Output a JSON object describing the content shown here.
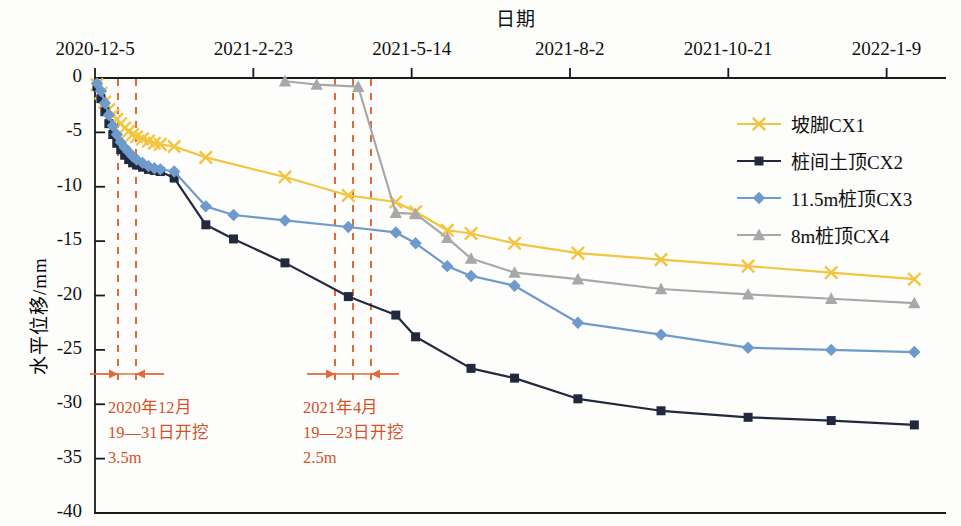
{
  "chart": {
    "title": "日期",
    "ylabel": "水平位移/mm",
    "xlabel": ""
  },
  "axes": {
    "x_tick_labels": [
      "2020-12-5",
      "2021-2-23",
      "2021-5-14",
      "2021-8-2",
      "2021-10-21",
      "2022-1-9"
    ],
    "y_tick_labels": [
      "0",
      "-5",
      "-10",
      "-15",
      "-20",
      "-25",
      "-30",
      "-35",
      "-40"
    ]
  },
  "legend": {
    "items": [
      {
        "label": "坡脚CX1",
        "color": "#F3C53F",
        "marker": "x-marker"
      },
      {
        "label": "桩间土顶CX2",
        "color": "#22293F",
        "marker": "square-marker"
      },
      {
        "label": "11.5m桩顶CX3",
        "color": "#6E9BCB",
        "marker": "diamond-marker"
      },
      {
        "label": "8m桩顶CX4",
        "color": "#A8A8A8",
        "marker": "triangle-marker"
      }
    ]
  },
  "annotations": [
    {
      "name": "excavation-1",
      "lines": [
        "2020年12月",
        "19—31日开挖",
        "3.5m"
      ],
      "color": "#D2522A",
      "span_start_x": 118,
      "span_end_x": 136
    },
    {
      "name": "excavation-2",
      "lines": [
        "2021年4月",
        "19—23日开挖",
        "2.5m"
      ],
      "color": "#D2522A",
      "span_start_x": 335,
      "span_end_x": 371
    }
  ],
  "marker_lines": {
    "color": "#E2693A",
    "group1_x": [
      118,
      136
    ],
    "group2_x": [
      335,
      353,
      371
    ]
  },
  "chart_data": {
    "type": "line",
    "title": "日期",
    "xlabel": "日期",
    "ylabel": "水平位移/mm",
    "ylim": [
      -40,
      0
    ],
    "xlim": [
      0,
      430
    ],
    "grid": false,
    "legend_position": "upper-right",
    "x_axis_type": "date",
    "x_tick_dates": [
      "2020-12-5",
      "2021-2-23",
      "2021-5-14",
      "2021-8-2",
      "2021-10-21",
      "2022-1-9"
    ],
    "x_tick_days": [
      0,
      80,
      160,
      240,
      320,
      400
    ],
    "series": [
      {
        "name": "坡脚CX1",
        "color": "#F3C53F",
        "marker": "x-marker",
        "points": [
          [
            1,
            -0.6
          ],
          [
            3,
            -1.4
          ],
          [
            5,
            -2.2
          ],
          [
            7,
            -2.9
          ],
          [
            9,
            -3.4
          ],
          [
            11,
            -3.8
          ],
          [
            13,
            -4.2
          ],
          [
            15,
            -4.6
          ],
          [
            17,
            -4.9
          ],
          [
            19,
            -5.2
          ],
          [
            21,
            -5.4
          ],
          [
            24,
            -5.6
          ],
          [
            27,
            -5.8
          ],
          [
            30,
            -6.0
          ],
          [
            33,
            -6.1
          ],
          [
            40,
            -6.3
          ],
          [
            56,
            -7.3
          ],
          [
            96,
            -9.1
          ],
          [
            128,
            -10.8
          ],
          [
            152,
            -11.4
          ],
          [
            162,
            -12.3
          ],
          [
            178,
            -14.0
          ],
          [
            190,
            -14.3
          ],
          [
            212,
            -15.2
          ],
          [
            244,
            -16.1
          ],
          [
            286,
            -16.7
          ],
          [
            330,
            -17.3
          ],
          [
            372,
            -17.9
          ],
          [
            414,
            -18.5
          ]
        ]
      },
      {
        "name": "桩间土顶CX2",
        "color": "#22293F",
        "marker": "square-marker",
        "points": [
          [
            1,
            -0.8
          ],
          [
            3,
            -1.9
          ],
          [
            5,
            -3.1
          ],
          [
            7,
            -4.2
          ],
          [
            9,
            -5.2
          ],
          [
            11,
            -6.0
          ],
          [
            13,
            -6.6
          ],
          [
            15,
            -7.1
          ],
          [
            17,
            -7.5
          ],
          [
            19,
            -7.8
          ],
          [
            21,
            -8.0
          ],
          [
            24,
            -8.2
          ],
          [
            27,
            -8.4
          ],
          [
            30,
            -8.5
          ],
          [
            33,
            -8.6
          ],
          [
            40,
            -9.2
          ],
          [
            56,
            -13.5
          ],
          [
            70,
            -14.8
          ],
          [
            96,
            -17.0
          ],
          [
            128,
            -20.1
          ],
          [
            152,
            -21.8
          ],
          [
            162,
            -23.8
          ],
          [
            190,
            -26.7
          ],
          [
            212,
            -27.6
          ],
          [
            244,
            -29.5
          ],
          [
            286,
            -30.6
          ],
          [
            330,
            -31.2
          ],
          [
            372,
            -31.5
          ],
          [
            414,
            -31.9
          ]
        ]
      },
      {
        "name": "11.5m桩顶CX3",
        "color": "#6E9BCB",
        "marker": "diamond-marker",
        "points": [
          [
            1,
            -0.5
          ],
          [
            3,
            -1.2
          ],
          [
            5,
            -2.3
          ],
          [
            7,
            -3.4
          ],
          [
            9,
            -4.4
          ],
          [
            11,
            -5.2
          ],
          [
            13,
            -5.9
          ],
          [
            15,
            -6.4
          ],
          [
            17,
            -6.8
          ],
          [
            19,
            -7.2
          ],
          [
            21,
            -7.5
          ],
          [
            24,
            -7.8
          ],
          [
            27,
            -8.1
          ],
          [
            30,
            -8.3
          ],
          [
            33,
            -8.4
          ],
          [
            40,
            -8.6
          ],
          [
            56,
            -11.8
          ],
          [
            70,
            -12.6
          ],
          [
            96,
            -13.1
          ],
          [
            128,
            -13.7
          ],
          [
            152,
            -14.2
          ],
          [
            162,
            -15.2
          ],
          [
            178,
            -17.3
          ],
          [
            190,
            -18.2
          ],
          [
            212,
            -19.1
          ],
          [
            244,
            -22.5
          ],
          [
            286,
            -23.6
          ],
          [
            330,
            -24.8
          ],
          [
            372,
            -25.0
          ],
          [
            414,
            -25.2
          ]
        ]
      },
      {
        "name": "8m桩顶CX4",
        "color": "#A8A8A8",
        "marker": "triangle-marker",
        "points": [
          [
            96,
            -0.3
          ],
          [
            112,
            -0.6
          ],
          [
            133,
            -0.8
          ],
          [
            152,
            -12.4
          ],
          [
            162,
            -12.5
          ],
          [
            178,
            -14.7
          ],
          [
            190,
            -16.6
          ],
          [
            212,
            -17.9
          ],
          [
            244,
            -18.5
          ],
          [
            286,
            -19.4
          ],
          [
            330,
            -19.9
          ],
          [
            372,
            -20.3
          ],
          [
            414,
            -20.7
          ]
        ]
      }
    ]
  }
}
